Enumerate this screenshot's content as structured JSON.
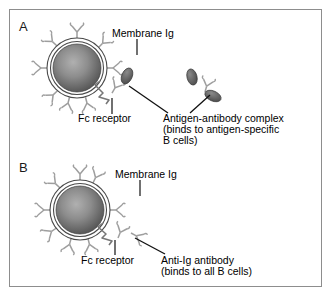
{
  "figure": {
    "background_color": "#ffffff",
    "frame_color": "#8d8d8d"
  },
  "colors": {
    "outline": "#3a3a3a",
    "antibody": "#a8a8a8",
    "antigen_fill": "#6b6b6b",
    "nucleus_center": "#9a9a9a",
    "nucleus_edge": "#4a4a4a",
    "leader_line": "#111111",
    "text": "#000000"
  },
  "panels": [
    {
      "id": "A",
      "letter": "A",
      "cell": {
        "name": "B cell",
        "membrane": "double-ring",
        "nucleus": "radial-gradient-gray"
      },
      "labels": [
        {
          "name": "membrane-ig",
          "lines": [
            "Membrane Ig"
          ]
        },
        {
          "name": "fc-receptor",
          "lines": [
            "Fc receptor"
          ]
        },
        {
          "name": "antigen-antibody-complex",
          "lines": [
            "Antigen-antibody complex",
            "(binds to antigen-specific",
            "B cells)"
          ]
        }
      ],
      "elements": [
        "membrane-immunoglobulin",
        "fc-receptor",
        "antigen-antibody-complex-bound",
        "antigen-antibody-complex-free"
      ]
    },
    {
      "id": "B",
      "letter": "B",
      "cell": {
        "name": "B cell",
        "membrane": "double-ring",
        "nucleus": "radial-gradient-gray"
      },
      "labels": [
        {
          "name": "membrane-ig",
          "lines": [
            "Membrane Ig"
          ]
        },
        {
          "name": "fc-receptor",
          "lines": [
            "Fc receptor"
          ]
        },
        {
          "name": "anti-ig-antibody",
          "lines": [
            "Anti-Ig antibody",
            "(binds to all B cells)"
          ]
        }
      ],
      "elements": [
        "membrane-immunoglobulin",
        "fc-receptor",
        "anti-ig-antibody"
      ]
    }
  ],
  "text": {
    "panel_a_letter": "A",
    "panel_b_letter": "B",
    "membrane_ig_a": "Membrane Ig",
    "fc_receptor_a": "Fc receptor",
    "complex_line1": "Antigen-antibody complex",
    "complex_line2": "(binds to antigen-specific",
    "complex_line3": "B cells)",
    "membrane_ig_b": "Membrane Ig",
    "fc_receptor_b": "Fc receptor",
    "antiig_line1": "Anti-Ig antibody",
    "antiig_line2": "(binds to all B cells)"
  }
}
